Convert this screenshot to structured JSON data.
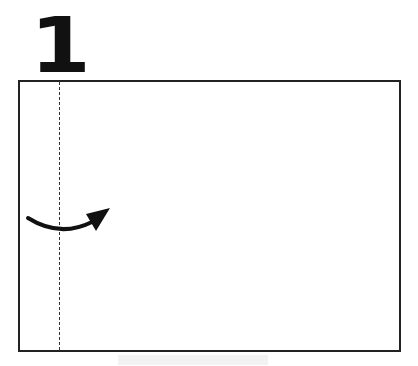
{
  "step": {
    "number": "1"
  },
  "diagram": {
    "fold_line": {
      "style": "dashed",
      "orientation": "vertical"
    },
    "arrow": {
      "direction": "left-to-right",
      "shape": "curved"
    },
    "colors": {
      "stroke": "#222222",
      "background": "#ffffff"
    }
  }
}
